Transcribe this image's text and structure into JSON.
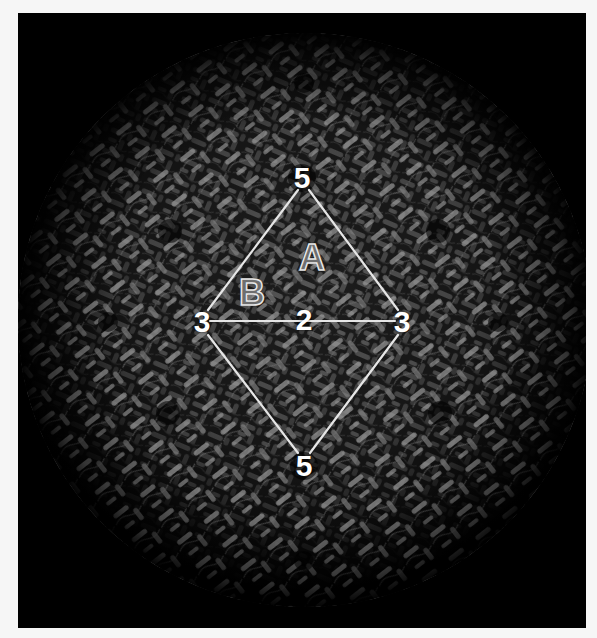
{
  "figure": {
    "background_color": "#000000",
    "page_color": "#f6f6f6",
    "overlay_line_color": "#e6e6e6"
  },
  "symmetry_axes": [
    {
      "id": "fivefold-top",
      "label": "5",
      "x": 284,
      "y": 165
    },
    {
      "id": "threefold-left",
      "label": "3",
      "x": 184,
      "y": 309
    },
    {
      "id": "twofold-center",
      "label": "2",
      "x": 286,
      "y": 307
    },
    {
      "id": "threefold-right",
      "label": "3",
      "x": 384,
      "y": 309
    },
    {
      "id": "fivefold-bottom",
      "label": "5",
      "x": 286,
      "y": 453
    }
  ],
  "asymmetric_units": [
    {
      "id": "unit-a",
      "label": "A",
      "x": 294,
      "y": 245
    },
    {
      "id": "unit-b",
      "label": "B",
      "x": 234,
      "y": 280
    }
  ]
}
